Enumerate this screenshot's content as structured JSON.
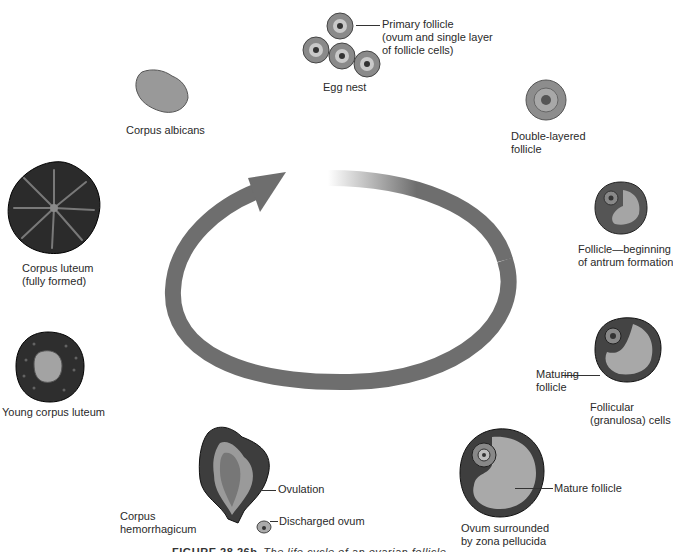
{
  "diagram": {
    "type": "cycle",
    "cycle_arrow": {
      "direction": "clockwise",
      "color": "#6e6e6e"
    },
    "stages": [
      {
        "id": "egg-nest",
        "label": "Egg nest"
      },
      {
        "id": "primary-follicle",
        "label": "Primary follicle",
        "sublabel_1": "(ovum and single layer",
        "sublabel_2": "of follicle cells)"
      },
      {
        "id": "double-layered-follicle",
        "label_1": "Double-layered",
        "label_2": "follicle"
      },
      {
        "id": "antrum-follicle",
        "label_1": "Follicle—beginning",
        "label_2": "of antrum formation"
      },
      {
        "id": "maturing-follicle",
        "label_1": "Maturing",
        "label_2": "follicle",
        "extra_1": "Follicular",
        "extra_2": "(granulosa) cells"
      },
      {
        "id": "mature-follicle",
        "label": "Mature follicle",
        "extra_1": "Ovum surrounded",
        "extra_2": "by zona pellucida"
      },
      {
        "id": "ovulation",
        "label": "Ovulation",
        "extra": "Discharged ovum"
      },
      {
        "id": "corpus-hemorrhagicum",
        "label_1": "Corpus",
        "label_2": "hemorrhagicum"
      },
      {
        "id": "young-corpus-luteum",
        "label": "Young corpus luteum"
      },
      {
        "id": "corpus-luteum",
        "label_1": "Corpus luteum",
        "label_2": "(fully formed)"
      },
      {
        "id": "corpus-albicans",
        "label": "Corpus albicans"
      }
    ]
  },
  "caption": {
    "figure": "FIGURE 28.26b",
    "text": "The life cycle of an ovarian follicle"
  }
}
